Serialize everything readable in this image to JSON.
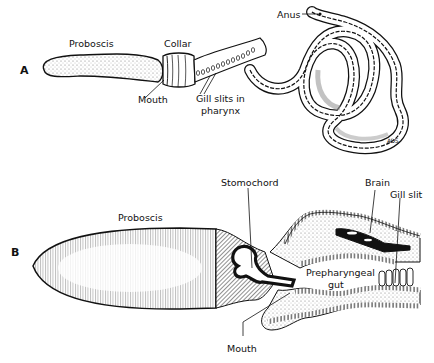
{
  "figure": {
    "panels": [
      {
        "id": "A",
        "letter": "A",
        "labels": {
          "proboscis": "Proboscis",
          "collar": "Collar",
          "mouth": "Mouth",
          "gill_slits_line1": "Gill slits in",
          "gill_slits_line2": "pharynx",
          "anus": "Anus"
        },
        "signature": "ADS"
      },
      {
        "id": "B",
        "letter": "B",
        "labels": {
          "proboscis": "Proboscis",
          "stomochord": "Stomochord",
          "brain": "Brain",
          "gill_slit": "Gill slit",
          "prepharyngeal_line1": "Prepharyngeal",
          "prepharyngeal_line2": "gut",
          "mouth": "Mouth"
        }
      }
    ],
    "colors": {
      "ink": "#111111",
      "background": "#ffffff",
      "stipple": "#bdbdbd"
    }
  }
}
